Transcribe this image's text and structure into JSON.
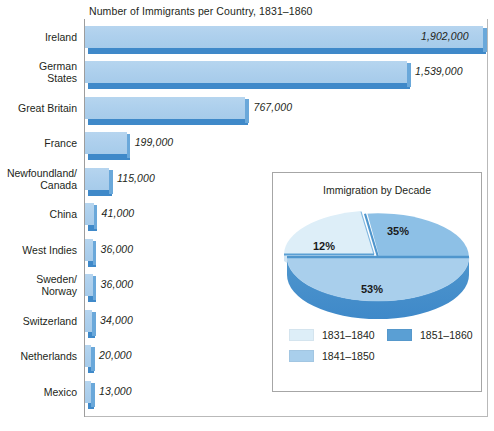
{
  "chart_data": [
    {
      "type": "bar",
      "orientation": "horizontal",
      "title": "Number of Immigrants per Country, 1831–1860",
      "xlabel": "",
      "ylabel": "",
      "grid": false,
      "xlim": [
        0,
        2000000
      ],
      "categories": [
        "Ireland",
        "German\nStates",
        "Great Britain",
        "France",
        "Newfoundland/\nCanada",
        "China",
        "West Indies",
        "Sweden/\nNorway",
        "Switzerland",
        "Netherlands",
        "Mexico"
      ],
      "values": [
        1902000,
        1539000,
        767000,
        199000,
        115000,
        41000,
        36000,
        36000,
        34000,
        20000,
        13000
      ],
      "value_labels": [
        "1,902,000",
        "1,539,000",
        "767,000",
        "199,000",
        "115,000",
        "41,000",
        "36,000",
        "36,000",
        "34,000",
        "20,000",
        "13,000"
      ],
      "bar_fill_top": "#aed0ed",
      "bar_fill_front": "#3f89c9",
      "bar_fill_side": "#6aa8da"
    },
    {
      "type": "pie",
      "title": "Immigration by Decade",
      "labels": [
        "1831–1840",
        "1841–1850",
        "1851–1860"
      ],
      "values": [
        12,
        53,
        35
      ],
      "value_labels": [
        "12%",
        "53%",
        "35%"
      ],
      "colors": [
        "#ddeef8",
        "#a9cfec",
        "#5a9fd4"
      ],
      "legend_position": "bottom",
      "exploded": [
        "1831–1840"
      ]
    }
  ],
  "bars": [
    {
      "label": "Ireland",
      "value_label": "1,902,000",
      "value": 1902000
    },
    {
      "label": "German\nStates",
      "value_label": "1,539,000",
      "value": 1539000
    },
    {
      "label": "Great Britain",
      "value_label": "767,000",
      "value": 767000
    },
    {
      "label": "France",
      "value_label": "199,000",
      "value": 199000
    },
    {
      "label": "Newfoundland/\nCanada",
      "value_label": "115,000",
      "value": 115000
    },
    {
      "label": "China",
      "value_label": "41,000",
      "value": 41000
    },
    {
      "label": "West Indies",
      "value_label": "36,000",
      "value": 36000
    },
    {
      "label": "Sweden/\nNorway",
      "value_label": "36,000",
      "value": 36000
    },
    {
      "label": "Switzerland",
      "value_label": "34,000",
      "value": 34000
    },
    {
      "label": "Netherlands",
      "value_label": "20,000",
      "value": 20000
    },
    {
      "label": "Mexico",
      "value_label": "13,000",
      "value": 13000
    }
  ],
  "main": {
    "title": "Number of Immigrants per Country, 1831–1860"
  },
  "inset": {
    "title": "Immigration by Decade",
    "slices": [
      {
        "pct_label": "35%",
        "decade": "1851–1860"
      },
      {
        "pct_label": "12%",
        "decade": "1831–1840"
      },
      {
        "pct_label": "53%",
        "decade": "1841–1850"
      }
    ],
    "legend": [
      {
        "label": "1831–1840",
        "color": "#ddeef8"
      },
      {
        "label": "1851–1860",
        "color": "#5a9fd4"
      },
      {
        "label": "1841–1850",
        "color": "#a9cfec"
      }
    ]
  }
}
